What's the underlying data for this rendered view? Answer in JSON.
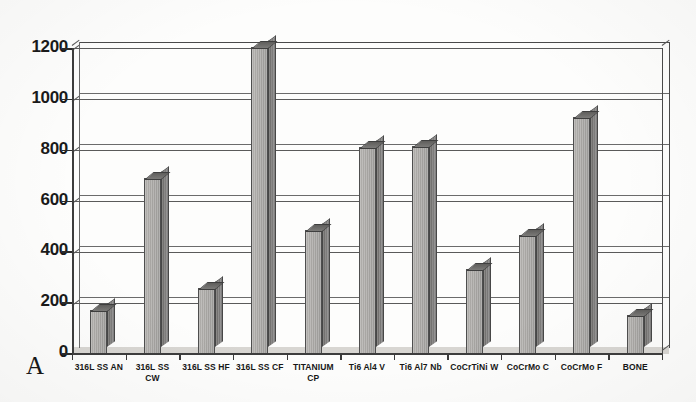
{
  "panel": {
    "letter": "A"
  },
  "chart_data": {
    "type": "bar",
    "title": "",
    "xlabel": "",
    "ylabel": "",
    "ylim": [
      0,
      1200
    ],
    "grid": true,
    "legend": "none",
    "style": "3d-column",
    "y_ticks": [
      0,
      200,
      400,
      600,
      800,
      1000,
      1200
    ],
    "y_tick_labels": [
      "0",
      "200",
      "400",
      "600",
      "800",
      "1000",
      "1200"
    ],
    "categories": [
      "316L SS AN",
      "316L SS\nCW",
      "316L SS HF",
      "316L SS CF",
      "TITANIUM\nCP",
      "Ti6 Al4 V",
      "Ti6 Al7 Nb",
      "CoCrTiNi W",
      "CoCrMo C",
      "CoCrMo F",
      "BONE"
    ],
    "values": [
      170,
      690,
      255,
      1205,
      485,
      810,
      815,
      330,
      465,
      930,
      150
    ],
    "bar_color": "#a6a4a1",
    "bar_side_color": "#74726f",
    "bar_top_color": "#6b6a68",
    "axis_color": "#3d3d3d",
    "grid_color": "#5a5a5a",
    "background_color": "#fdfdfc"
  }
}
